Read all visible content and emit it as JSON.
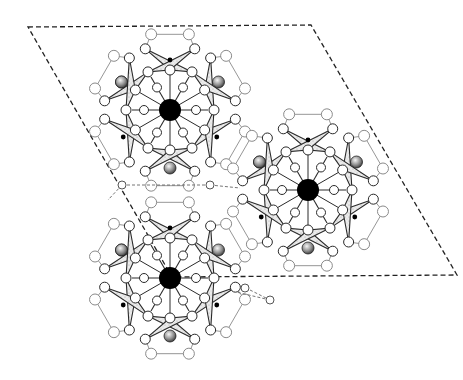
{
  "diagram": {
    "title": "Crystal structure projection",
    "type": "polyhedral crystal structure",
    "unit_cell": {
      "style": "dashed",
      "corners": [
        [
          28,
          27
        ],
        [
          311,
          25
        ],
        [
          457,
          275
        ],
        [
          172,
          277
        ]
      ]
    },
    "clusters": [
      {
        "id": "cluster-top-left",
        "center": [
          170,
          110
        ],
        "scale": 1.0
      },
      {
        "id": "cluster-right",
        "center": [
          308,
          190
        ],
        "scale": 1.0
      },
      {
        "id": "cluster-bottom-left",
        "center": [
          170,
          278
        ],
        "scale": 1.0
      }
    ],
    "legend": {
      "central_atom": "large black sphere",
      "polyhedra": "stippled tetrahedra",
      "anion": "open circle",
      "shaded_atom": "hatched sphere",
      "small_atom": "small black dot"
    },
    "colors": {
      "line": "#2a2a2a",
      "light_line": "#8a8a8a",
      "tetra_fill": "#e4e4e4",
      "atom_fill": "#ffffff",
      "central": "#000000",
      "hatched": "#7a7a7a"
    }
  }
}
